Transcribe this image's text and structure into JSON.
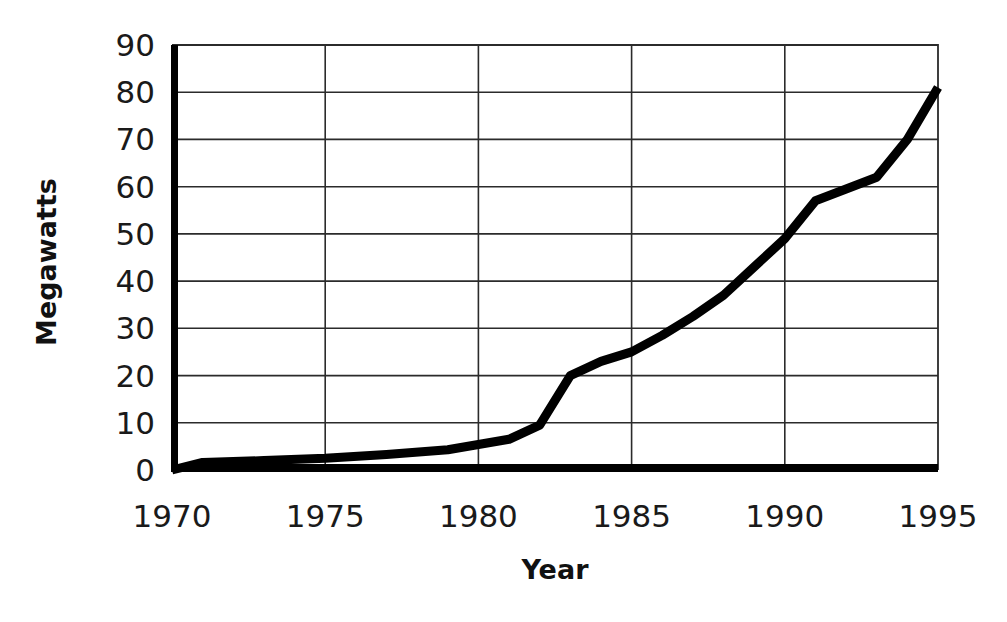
{
  "chart_data": {
    "type": "line",
    "title": "",
    "xlabel": "Year",
    "ylabel": "Megawatts",
    "xlim": [
      1970,
      1995
    ],
    "ylim": [
      0,
      90
    ],
    "grid": true,
    "legend": "none",
    "xticks": [
      1970,
      1975,
      1980,
      1985,
      1990,
      1995
    ],
    "xtick_labels": [
      "1970",
      "1975",
      "1980",
      "1985",
      "1990",
      "1995"
    ],
    "yticks": [
      0,
      10,
      20,
      30,
      40,
      50,
      60,
      70,
      80,
      90
    ],
    "ytick_labels": [
      "0",
      "10",
      "20",
      "30",
      "40",
      "50",
      "60",
      "70",
      "80",
      "90"
    ],
    "series": [
      {
        "name": "Megawatts",
        "color": "#000000",
        "x": [
          1970,
          1971,
          1973,
          1975,
          1977,
          1979,
          1981,
          1982,
          1983,
          1984,
          1985,
          1986,
          1987,
          1988,
          1989,
          1990,
          1991,
          1992,
          1993,
          1994,
          1995
        ],
        "values": [
          0,
          1.6,
          2.0,
          2.5,
          3.3,
          4.3,
          6.5,
          9.5,
          20.0,
          23.0,
          25.0,
          28.5,
          32.5,
          37.0,
          43.0,
          49.0,
          57.0,
          59.5,
          62.0,
          70.0,
          81.0
        ]
      }
    ]
  },
  "axes": {
    "y_title": "Megawatts",
    "x_title": "Year"
  }
}
